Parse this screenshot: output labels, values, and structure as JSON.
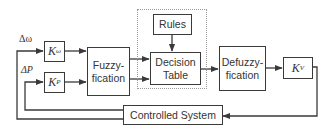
{
  "diagram": {
    "type": "block-diagram",
    "inputs": [
      {
        "id": "delta_omega",
        "label": "Δω"
      },
      {
        "id": "delta_p",
        "label": "ΔP"
      }
    ],
    "blocks": {
      "k_omega": {
        "base": "K",
        "sub": "ω"
      },
      "k_p": {
        "base": "K",
        "sub": "P"
      },
      "fuzzyfication": {
        "line1": "Fuzzy-",
        "line2": "fication"
      },
      "rules": {
        "label": "Rules"
      },
      "decision_table": {
        "line1": "Decision",
        "line2": "Table"
      },
      "defuzzyfication": {
        "line1": "Defuzzy-",
        "line2": "fication"
      },
      "k_v": {
        "base": "K",
        "sub": "V"
      },
      "controlled_system": {
        "label": "Controlled System"
      }
    },
    "edges": [
      [
        "delta_omega",
        "k_omega"
      ],
      [
        "delta_p",
        "k_p"
      ],
      [
        "k_omega",
        "fuzzyfication"
      ],
      [
        "k_p",
        "fuzzyfication"
      ],
      [
        "fuzzyfication",
        "decision_table"
      ],
      [
        "fuzzyfication",
        "decision_table"
      ],
      [
        "rules",
        "decision_table"
      ],
      [
        "decision_table",
        "defuzzyfication"
      ],
      [
        "defuzzyfication",
        "k_v"
      ],
      [
        "k_v",
        "controlled_system"
      ],
      [
        "controlled_system",
        "delta_omega"
      ],
      [
        "controlled_system",
        "delta_p"
      ]
    ],
    "colors": {
      "line": "#3a3a3a",
      "dotted_border": "#9a9a9a",
      "background": "#ffffff"
    }
  }
}
